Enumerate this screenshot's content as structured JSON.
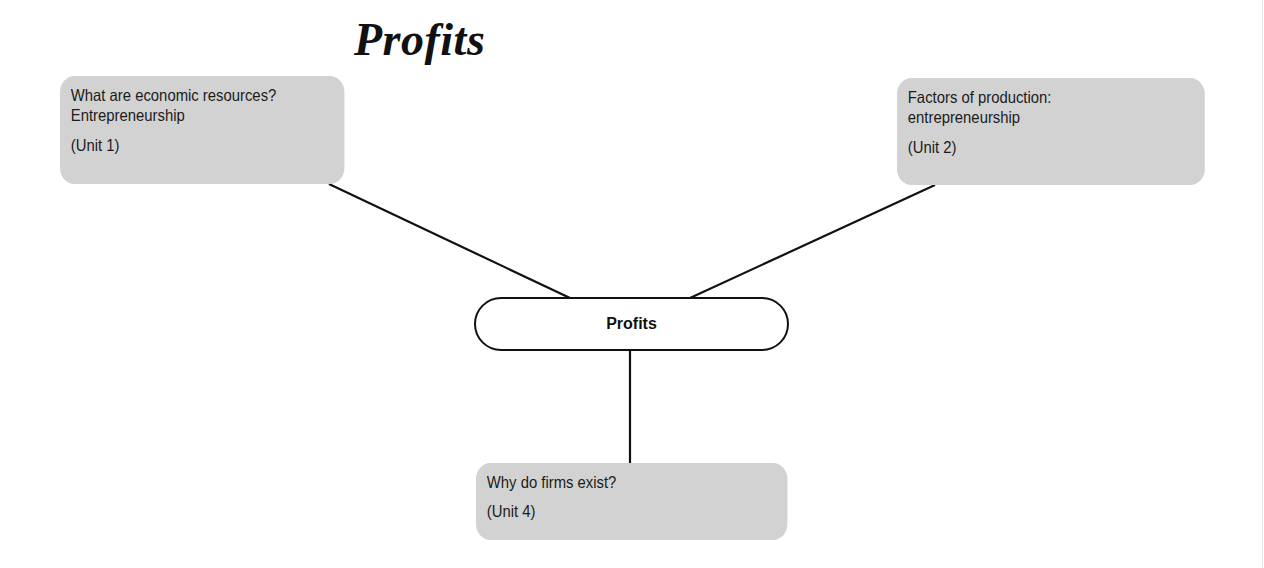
{
  "title": "Profits",
  "center_node": {
    "label": "Profits"
  },
  "nodes": [
    {
      "id": "left",
      "lines": [
        "What are economic resources?",
        "Entrepreneurship"
      ],
      "unit": "(Unit 1)"
    },
    {
      "id": "right",
      "lines": [
        "Factors of production:",
        "entrepreneurship"
      ],
      "unit": "(Unit 2)"
    },
    {
      "id": "bottom",
      "lines": [
        "Why do firms exist?"
      ],
      "unit": "(Unit 4)"
    }
  ],
  "colors": {
    "box_fill": "#d2d2d2",
    "line": "#111111",
    "background": "#ffffff"
  }
}
